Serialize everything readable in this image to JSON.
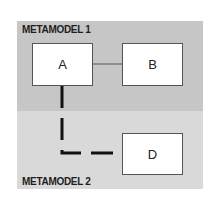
{
  "diagram": {
    "regions": [
      {
        "id": "metamodel-1",
        "label": "METAMODEL 1",
        "color": "#c6c6c6"
      },
      {
        "id": "metamodel-2",
        "label": "METAMODEL 2",
        "color": "#d9d9d9"
      }
    ],
    "nodes": [
      {
        "id": "A",
        "label": "A",
        "region": "metamodel-1"
      },
      {
        "id": "B",
        "label": "B",
        "region": "metamodel-1"
      },
      {
        "id": "D",
        "label": "D",
        "region": "metamodel-2"
      }
    ],
    "edges": [
      {
        "from": "A",
        "to": "B",
        "style": "solid-thin"
      },
      {
        "from": "A",
        "to": "D",
        "style": "dashed-thick"
      }
    ]
  }
}
